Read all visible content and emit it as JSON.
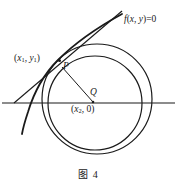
{
  "figure": {
    "caption": "图 4",
    "caption_number": "4",
    "background_color": "#ffffff",
    "stroke_color": "#1a1a1a",
    "width": 177,
    "height": 187
  },
  "labels": {
    "curve_equation": "f(x, y)=0",
    "curve_equation_parts": {
      "f": "f",
      "open": "(",
      "x": "x",
      "comma": ", ",
      "y": "y",
      "close": ")",
      "equals_zero": "=0"
    },
    "point_p1": "(x₁, y₁)",
    "point_p1_parts": {
      "open": "(",
      "x": "x",
      "x_sub": "1",
      "comma": ", ",
      "y": "y",
      "y_sub": "1",
      "close": ")"
    },
    "point_p": "P",
    "point_q": "Q",
    "point_q_coords": "(x₂, 0)",
    "point_q_coords_parts": {
      "open": "(",
      "x": "x",
      "x_sub": "2",
      "comma": ", ",
      "zero": "0",
      "close": ")"
    }
  },
  "geometry": {
    "axis": {
      "name": "horizontal-axis",
      "x1": 2,
      "y1": 103,
      "x2": 175,
      "y2": 103,
      "stroke_width": 1.1
    },
    "outer_circle": {
      "name": "outer-circle",
      "cx": 97,
      "cy": 99,
      "r": 55,
      "stroke_width": 1.2
    },
    "inner_circle": {
      "name": "inner-circle",
      "cx": 95,
      "cy": 103,
      "r": 47,
      "stroke_width": 1.2
    },
    "tangent_line": {
      "name": "tangent-line",
      "x1": 14,
      "y1": 103,
      "x2": 122,
      "y2": 11,
      "stroke_width": 1.1
    },
    "radius_segment": {
      "name": "radius-segment-pq",
      "x1": 62,
      "y1": 67,
      "x2": 93,
      "y2": 102,
      "stroke_width": 1.0
    },
    "curve": {
      "name": "implicit-curve",
      "path": "M 122 14 C 100 26, 76 42, 58 60 C 44 74, 34 92, 28 112 C 25 121, 23 128, 22 134",
      "stroke_width": 1.7
    },
    "point_markers": {
      "p": {
        "cx": 58.5,
        "cy": 60,
        "r": 1.4
      },
      "q": {
        "cx": 93,
        "cy": 102,
        "r": 1.3
      }
    }
  }
}
